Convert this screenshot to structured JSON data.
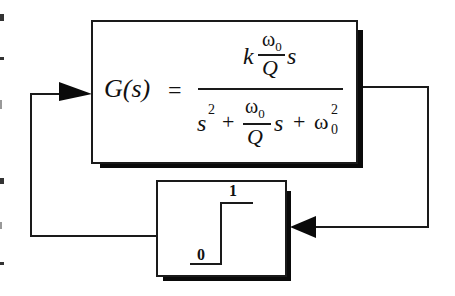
{
  "diagram": {
    "type": "feedback-loop-block-diagram",
    "transfer_block": {
      "lhs": "G(s)",
      "equals": "=",
      "numerator": {
        "coefficient": "k",
        "fraction_numerator": "ω",
        "fraction_numerator_sub": "0",
        "fraction_denominator": "Q",
        "variable": "s"
      },
      "denominator": {
        "term1": "s",
        "term1_sup": "2",
        "plus1": "+",
        "fraction_numerator": "ω",
        "fraction_numerator_sub": "0",
        "fraction_denominator": "Q",
        "variable": "s",
        "plus2": "+",
        "term3": "ω",
        "term3_sub": "0",
        "term3_sup": "2"
      }
    },
    "comparator_block": {
      "low_label": "0",
      "high_label": "1"
    },
    "colors": {
      "line": "#1a1a1a",
      "shadow": "#0a0a0a",
      "background": "#ffffff"
    }
  }
}
